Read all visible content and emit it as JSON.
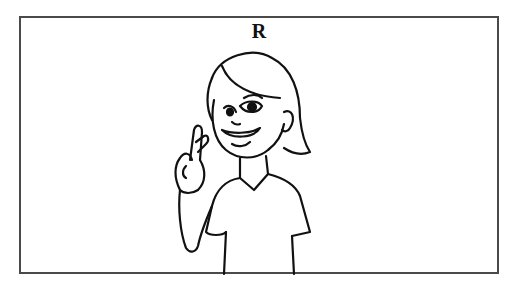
{
  "card": {
    "letter": "R",
    "illustration": "cartoon girl signing the letter R in sign language (crossed index and middle fingers)",
    "border_color": "#4a4a4a"
  }
}
